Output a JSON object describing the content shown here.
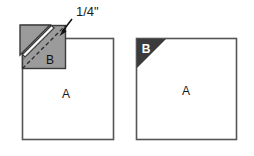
{
  "figure": {
    "background_color": "#ffffff",
    "colors": {
      "outline": "#555555",
      "piece_a_fill": "#ffffff",
      "piece_b_fill_left": "#9b9b9b",
      "piece_b_fill_right": "#3b3b3b",
      "fold_line": "#3a3a3a",
      "seam_stripe": "#ffffff",
      "label_text_dark": "#1a1a1a",
      "label_text_light": "#ffffff",
      "arrow": "#111111"
    },
    "annotations": {
      "seam_allowance": "1/4\""
    },
    "panels": [
      {
        "name": "left-panel",
        "caption": "",
        "piece_a_label": "A",
        "piece_b_label": "B",
        "piece_b_label_color": "dark",
        "has_fold_flap": true,
        "has_seam_annotation": true
      },
      {
        "name": "right-panel",
        "caption": "",
        "piece_a_label": "A",
        "piece_b_label": "B",
        "piece_b_label_color": "light",
        "has_fold_flap": false,
        "has_seam_annotation": false
      }
    ]
  }
}
